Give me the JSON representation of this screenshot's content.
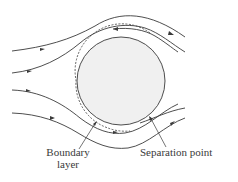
{
  "diagram": {
    "labels": {
      "boundary_layer_line1": "Boundary",
      "boundary_layer_line2": "layer",
      "separation_point": "Separation point"
    },
    "colors": {
      "stroke": "#3a3a3a",
      "cylinder_fill": "#f0f0f0",
      "background": "#ffffff"
    }
  }
}
